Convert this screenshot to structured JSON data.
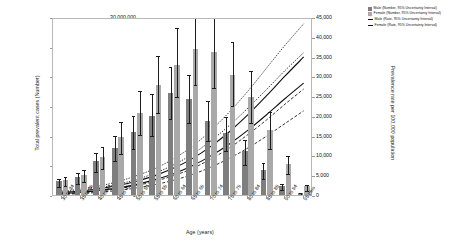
{
  "chart_data": {
    "type": "bar",
    "title": "",
    "xlabel": "Age (years)",
    "ylabel": "Total prevalent cases (Number)",
    "ylabel_secondary": "Prevalence rate per 100,000 population",
    "categories": [
      "30 to 34",
      "35 to 39",
      "40 to 44",
      "45 to 49",
      "50 to 54",
      "55 to 59",
      "60 to 64",
      "65 to 69",
      "70 to 74",
      "75 to 79",
      "80 to 84",
      "85 to 89",
      "90 to 94",
      "95 plus"
    ],
    "ylim": [
      0,
      30000000
    ],
    "ytick_labels": [
      "0",
      "5,000,000",
      "10,000,000",
      "15,000,000",
      "20,000,000",
      "25,000,000",
      "30,000,000"
    ],
    "ytick_values": [
      0,
      5000000,
      10000000,
      15000000,
      20000000,
      25000000,
      30000000
    ],
    "ylim_secondary": [
      0,
      45000
    ],
    "ytick_labels_secondary": [
      "0",
      "5,000",
      "10,000",
      "15,000",
      "20,000",
      "25,000",
      "30,000",
      "35,000",
      "40,000",
      "45,000"
    ],
    "ytick_values_secondary": [
      0,
      5000,
      10000,
      15000,
      20000,
      25000,
      30000,
      35000,
      40000,
      45000
    ],
    "grid": false,
    "legend_position": "top-right",
    "series": [
      {
        "name": "Male (Number, 95% Uncertainty Interval)",
        "kind": "bar",
        "color": "#7e7e7e",
        "axis": "left",
        "values": [
          2300000,
          3000000,
          5700000,
          7900000,
          10600000,
          13400000,
          17200000,
          16200000,
          12500000,
          10500000,
          7400000,
          4300000,
          1600000,
          400000
        ],
        "lower": [
          1700000,
          2200000,
          4200000,
          6000000,
          8100000,
          10200000,
          13200000,
          12400000,
          9400000,
          7800000,
          5400000,
          3100000,
          1100000,
          250000
        ],
        "upper": [
          3100000,
          4000000,
          7500000,
          10300000,
          13700000,
          17300000,
          21900000,
          20600000,
          16100000,
          13500000,
          9600000,
          5700000,
          2200000,
          600000
        ]
      },
      {
        "name": "Female (Number, 95% Uncertainty Interval)",
        "kind": "bar",
        "color": "#a9a9a9",
        "axis": "left",
        "values": [
          2500000,
          3400000,
          6400000,
          9700000,
          13800000,
          18500000,
          21900000,
          24600000,
          24100000,
          20200000,
          16500000,
          11000000,
          5200000,
          1500000
        ],
        "lower": [
          1800000,
          2500000,
          4700000,
          7300000,
          10500000,
          14200000,
          16800000,
          18800000,
          18400000,
          15300000,
          12400000,
          8100000,
          3800000,
          1000000
        ],
        "upper": [
          3300000,
          4500000,
          8400000,
          12600000,
          17900000,
          23800000,
          28400000,
          31900000,
          31200000,
          26100000,
          21300000,
          14300000,
          6900000,
          2100000
        ]
      },
      {
        "name": "Male (Rate, 95% Uncertainty Interval)",
        "kind": "line",
        "color": "#111111",
        "axis": "right",
        "style": "solid",
        "values": [
          1100,
          1500,
          2100,
          2900,
          4000,
          5400,
          7300,
          9700,
          12800,
          16500,
          20800,
          25600,
          30600,
          35400
        ],
        "lower": [
          800,
          1100,
          1500,
          2100,
          2900,
          4000,
          5400,
          7200,
          9600,
          12400,
          15800,
          19500,
          23500,
          27300
        ],
        "upper": [
          1500,
          2000,
          2800,
          3900,
          5400,
          7200,
          9700,
          12800,
          16800,
          21500,
          26800,
          32600,
          38400,
          43800
        ]
      },
      {
        "name": "Female (Rate, 95% Uncertainty Interval)",
        "kind": "line",
        "color": "#111111",
        "axis": "right",
        "style": "solid",
        "values": [
          900,
          1200,
          1700,
          2300,
          3200,
          4400,
          5900,
          7900,
          10400,
          13400,
          16900,
          20800,
          24900,
          28800
        ],
        "lower": [
          650,
          880,
          1200,
          1650,
          2300,
          3150,
          4250,
          5700,
          7550,
          9800,
          12400,
          15400,
          18600,
          21800
        ],
        "upper": [
          1250,
          1700,
          2350,
          3200,
          4450,
          6050,
          8150,
          10800,
          14200,
          18100,
          22500,
          27200,
          32000,
          36500
        ]
      }
    ]
  },
  "legend": {
    "items": [
      {
        "label": "Male (Number, 95% Uncertainty Interval)",
        "marker": "swatch-male"
      },
      {
        "label": "Female (Number, 95% Uncertainty Interval)",
        "marker": "swatch-female"
      },
      {
        "label": "Male (Rate, 95% Uncertainty Interval)",
        "marker": "line"
      },
      {
        "label": "Female (Rate, 95% Uncertainty Interval)",
        "marker": "line"
      }
    ]
  }
}
